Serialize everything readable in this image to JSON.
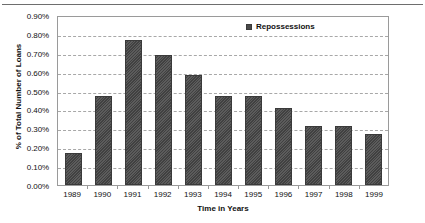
{
  "chart_data": {
    "type": "bar",
    "title": "",
    "xlabel": "Time in Years",
    "ylabel": "% of Total Number of Loans",
    "categories": [
      "1989",
      "1990",
      "1991",
      "1992",
      "1993",
      "1994",
      "1995",
      "1996",
      "1997",
      "1998",
      "1999"
    ],
    "values": [
      0.17,
      0.47,
      0.77,
      0.69,
      0.58,
      0.47,
      0.47,
      0.41,
      0.31,
      0.31,
      0.27
    ],
    "series": [
      {
        "name": "Repossessions",
        "values": [
          0.17,
          0.47,
          0.77,
          0.69,
          0.58,
          0.47,
          0.47,
          0.41,
          0.31,
          0.31,
          0.27
        ]
      }
    ],
    "ylim": [
      0.0,
      0.9
    ],
    "ytick_step": 0.1,
    "ytick_labels": [
      "0.90%",
      "0.80%",
      "0.70%",
      "0.60%",
      "0.50%",
      "0.40%",
      "0.30%",
      "0.20%",
      "0.10%",
      "0.00%"
    ],
    "ytick_values": [
      0.9,
      0.8,
      0.7,
      0.6,
      0.5,
      0.4,
      0.3,
      0.2,
      0.1,
      0.0
    ],
    "value_suffix": "%",
    "grid": true,
    "grid_axis": "y",
    "grid_style": "dashed",
    "legend": {
      "position": "top-center",
      "entries": [
        "Repossessions"
      ]
    },
    "colors": {
      "bar": "#4a4a4a",
      "bar_border": "#3a3a3a",
      "gridline": "#a8a8a8",
      "frame": "#9a9a9a",
      "text": "#111111",
      "background": "#ffffff"
    }
  },
  "legend": {
    "label": "Repossessions"
  },
  "axes": {
    "x_title": "Time in Years",
    "y_title": "% of Total Number of Loans"
  }
}
